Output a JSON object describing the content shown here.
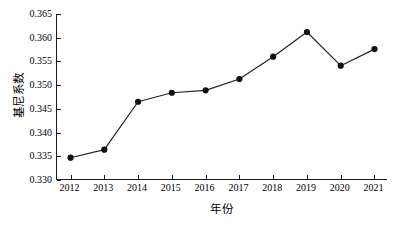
{
  "chart_data": {
    "type": "line",
    "title": "",
    "xlabel": "年份",
    "ylabel": "基尼系数",
    "categories": [
      "2012",
      "2013",
      "2014",
      "2015",
      "2016",
      "2017",
      "2018",
      "2019",
      "2020",
      "2021"
    ],
    "x": [
      2012,
      2013,
      2014,
      2015,
      2016,
      2017,
      2018,
      2019,
      2020,
      2021
    ],
    "values": [
      0.3347,
      0.3364,
      0.3465,
      0.3484,
      0.3489,
      0.3513,
      0.356,
      0.3612,
      0.3541,
      0.3576
    ],
    "series": [
      {
        "name": "基尼系数",
        "values": [
          0.3347,
          0.3364,
          0.3465,
          0.3484,
          0.3489,
          0.3513,
          0.356,
          0.3612,
          0.3541,
          0.3576
        ]
      }
    ],
    "ylim": [
      0.33,
      0.365
    ],
    "xlim": [
      2011.6,
      2021.4
    ],
    "yticks": [
      0.33,
      0.335,
      0.34,
      0.345,
      0.35,
      0.355,
      0.36,
      0.365
    ],
    "ytick_labels": [
      "0.330",
      "0.335",
      "0.340",
      "0.345",
      "0.350",
      "0.355",
      "0.360",
      "0.365"
    ],
    "xtick_labels": [
      "2012",
      "2013",
      "2014",
      "2015",
      "2016",
      "2017",
      "2018",
      "2019",
      "2020",
      "2021"
    ],
    "grid": false,
    "legend": false,
    "legend_position": "none",
    "marker": "circle",
    "marker_color": "#111111",
    "line_color": "#222222",
    "background_color": "#ffffff",
    "axis_color": "#1a1a1a"
  }
}
